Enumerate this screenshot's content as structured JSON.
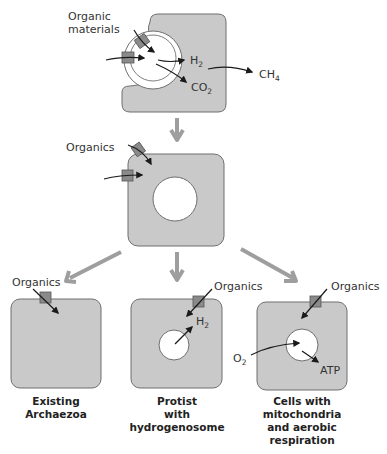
{
  "colors": {
    "cell_fill": "#c9c9c9",
    "cell_stroke": "#6f6f6f",
    "transporter": "#8a8a8a",
    "arrow_dark": "#1a1a1a",
    "arrow_gray": "#9e9e9e"
  },
  "stage1": {
    "input_label_line1": "Organic",
    "input_label_line2": "materials",
    "h2": "H",
    "h2_sub": "2",
    "co2": "CO",
    "co2_sub": "2",
    "ch4": "CH",
    "ch4_sub": "4"
  },
  "stage2": {
    "input_label": "Organics"
  },
  "outcomes": [
    {
      "input_label": "Organics",
      "caption_lines": [
        "Existing",
        "Archaezoa"
      ]
    },
    {
      "input_label": "Organics",
      "product": "H",
      "product_sub": "2",
      "caption_lines": [
        "Protist",
        "with",
        "hydrogenosome"
      ]
    },
    {
      "input_label": "Organics",
      "o2": "O",
      "o2_sub": "2",
      "product": "ATP",
      "caption_lines": [
        "Cells with",
        "mitochondria",
        "and aerobic",
        "respiration"
      ]
    }
  ]
}
